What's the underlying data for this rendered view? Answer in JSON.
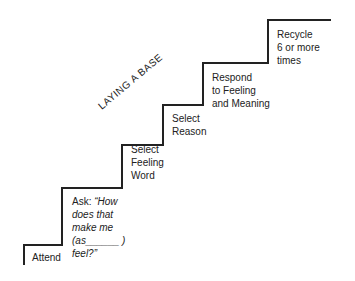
{
  "diagram": {
    "title": "LAYING A BASE",
    "steps": [
      {
        "lines": [
          "Attend"
        ]
      },
      {
        "prefix": "Ask: ",
        "lines": [
          "“How",
          "does that",
          "make me",
          "(as______ )",
          "feel?”"
        ]
      },
      {
        "lines": [
          "Select",
          "Feeling",
          "Word"
        ]
      },
      {
        "lines": [
          "Select",
          "Reason"
        ]
      },
      {
        "lines": [
          "Respond",
          "to Feeling",
          "and Meaning"
        ]
      },
      {
        "lines": [
          "Recycle",
          "6 or more",
          "times"
        ]
      }
    ],
    "line_color": "#222222"
  }
}
